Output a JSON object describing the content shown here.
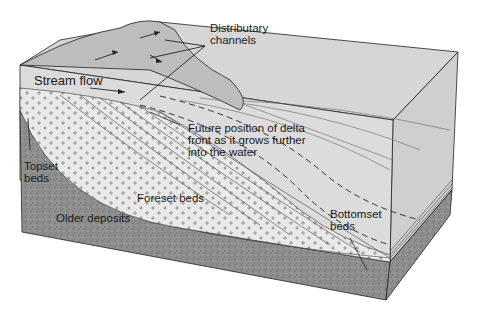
{
  "figure": {
    "type": "block diagram",
    "colors": {
      "background": "#ffffff",
      "water_top": "#d4d4d4",
      "water_side": "#c8c8c8",
      "foreset_fill": "#e6e6e6",
      "older_deposits": "#8e8e8e",
      "land_surface": "#bdbdbd",
      "outline": "#222222"
    }
  },
  "labels": {
    "distributary": "Distributary\nchannels",
    "stream_flow": "Stream flow",
    "future_position": "Future position of delta\nfront as it grows further\ninto the water",
    "topset": "Topset\nbeds",
    "foreset": "Foreset beds",
    "older": "Older deposits",
    "bottomset": "Bottomset\nbeds"
  }
}
